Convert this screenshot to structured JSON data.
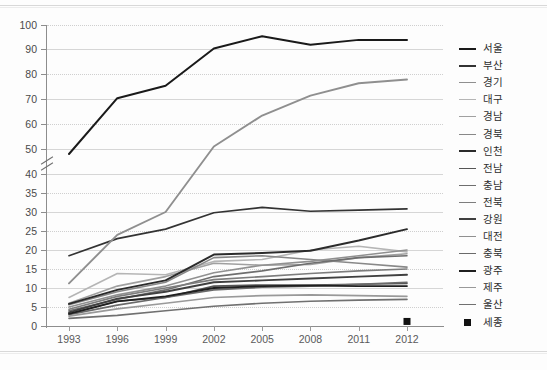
{
  "chart_data": {
    "type": "line",
    "title": "",
    "xlabel": "",
    "ylabel": "",
    "grid": true,
    "legend_position": "right",
    "x": [
      1993,
      1996,
      1999,
      2002,
      2005,
      2008,
      2011,
      2012
    ],
    "xtick_labels": [
      "1993",
      "1996",
      "1999",
      "2002",
      "2005",
      "2008",
      "2011",
      "2012"
    ],
    "ytick_labels": [
      "0",
      "5",
      "10",
      "15",
      "20",
      "25",
      "30",
      "35",
      "40",
      "50",
      "60",
      "70",
      "80",
      "90",
      "100"
    ],
    "ylim": [
      0,
      100
    ],
    "axis_break": {
      "between": [
        40,
        50
      ],
      "note": "broken y-axis"
    },
    "series": [
      {
        "name": "서울",
        "color": "#1a1a1a",
        "width": 2.0,
        "values": [
          48.0,
          70.5,
          75.5,
          90.5,
          95.5,
          92.0,
          94.0,
          94.0
        ]
      },
      {
        "name": "부산",
        "color": "#333333",
        "width": 1.7,
        "values": [
          18.5,
          23.0,
          25.5,
          29.8,
          31.2,
          30.2,
          30.5,
          30.8
        ]
      },
      {
        "name": "경기",
        "color": "#8f8f8f",
        "width": 1.9,
        "values": [
          11.2,
          24.0,
          30.0,
          51.0,
          63.5,
          71.5,
          76.5,
          78.0
        ]
      },
      {
        "name": "대구",
        "color": "#b5b5b5",
        "width": 1.6,
        "values": [
          7.5,
          13.8,
          13.5,
          17.0,
          17.5,
          20.0,
          21.0,
          19.5
        ]
      },
      {
        "name": "경남",
        "color": "#a0a0a0",
        "width": 1.6,
        "values": [
          6.0,
          10.5,
          13.0,
          16.5,
          16.0,
          16.2,
          18.0,
          19.0
        ]
      },
      {
        "name": "경북",
        "color": "#888888",
        "width": 1.6,
        "values": [
          5.6,
          9.0,
          11.5,
          18.0,
          18.5,
          17.5,
          16.5,
          15.5
        ]
      },
      {
        "name": "인천",
        "color": "#2b2b2b",
        "width": 1.9,
        "values": [
          5.8,
          9.5,
          12.0,
          18.8,
          19.2,
          19.8,
          22.5,
          25.5
        ]
      },
      {
        "name": "전남",
        "color": "#555555",
        "width": 1.6,
        "values": [
          3.2,
          6.5,
          7.5,
          10.5,
          10.8,
          10.8,
          11.0,
          11.2
        ]
      },
      {
        "name": "충남",
        "color": "#6e6e6e",
        "width": 1.6,
        "values": [
          4.0,
          7.0,
          9.5,
          13.0,
          14.5,
          16.5,
          18.0,
          18.5
        ]
      },
      {
        "name": "전북",
        "color": "#7d7d7d",
        "width": 1.6,
        "values": [
          4.4,
          7.8,
          10.0,
          12.2,
          13.0,
          13.8,
          14.5,
          15.0
        ]
      },
      {
        "name": "강원",
        "color": "#404040",
        "width": 1.9,
        "values": [
          3.6,
          7.2,
          9.0,
          11.5,
          12.0,
          12.5,
          13.0,
          13.5
        ]
      },
      {
        "name": "대전",
        "color": "#909090",
        "width": 1.6,
        "values": [
          5.0,
          8.2,
          10.5,
          14.0,
          16.0,
          17.0,
          18.5,
          20.0
        ]
      },
      {
        "name": "충북",
        "color": "#6a6a6a",
        "width": 1.6,
        "values": [
          3.0,
          5.5,
          7.5,
          9.5,
          10.2,
          10.5,
          11.0,
          11.5
        ]
      },
      {
        "name": "광주",
        "color": "#1f1f1f",
        "width": 1.8,
        "values": [
          3.2,
          6.5,
          7.8,
          10.0,
          10.5,
          10.6,
          10.5,
          10.5
        ]
      },
      {
        "name": "제주",
        "color": "#999999",
        "width": 1.6,
        "values": [
          2.6,
          4.5,
          6.0,
          7.5,
          8.0,
          8.2,
          8.0,
          7.8
        ]
      },
      {
        "name": "울산",
        "color": "#707070",
        "width": 1.6,
        "values": [
          2.0,
          2.8,
          4.0,
          5.2,
          6.0,
          6.5,
          6.8,
          7.0
        ]
      },
      {
        "name": "세종",
        "color": "#111111",
        "marker": "square",
        "values": [
          null,
          null,
          null,
          null,
          null,
          null,
          null,
          1.2
        ]
      }
    ]
  },
  "legend": {
    "items": [
      {
        "label": "서울",
        "color": "#1a1a1a",
        "style": "line"
      },
      {
        "label": "부산",
        "color": "#333333",
        "style": "line"
      },
      {
        "label": "경기",
        "color": "#8f8f8f",
        "style": "line"
      },
      {
        "label": "대구",
        "color": "#b5b5b5",
        "style": "line"
      },
      {
        "label": "경남",
        "color": "#a0a0a0",
        "style": "line"
      },
      {
        "label": "경북",
        "color": "#888888",
        "style": "line"
      },
      {
        "label": "인천",
        "color": "#2b2b2b",
        "style": "line"
      },
      {
        "label": "전남",
        "color": "#555555",
        "style": "line"
      },
      {
        "label": "충남",
        "color": "#6e6e6e",
        "style": "line"
      },
      {
        "label": "전북",
        "color": "#7d7d7d",
        "style": "line"
      },
      {
        "label": "강원",
        "color": "#404040",
        "style": "line"
      },
      {
        "label": "대전",
        "color": "#909090",
        "style": "line"
      },
      {
        "label": "충북",
        "color": "#6a6a6a",
        "style": "line"
      },
      {
        "label": "광주",
        "color": "#1f1f1f",
        "style": "line"
      },
      {
        "label": "제주",
        "color": "#999999",
        "style": "line"
      },
      {
        "label": "울산",
        "color": "#707070",
        "style": "line"
      },
      {
        "label": "세종",
        "color": "#111111",
        "style": "marker"
      }
    ]
  }
}
